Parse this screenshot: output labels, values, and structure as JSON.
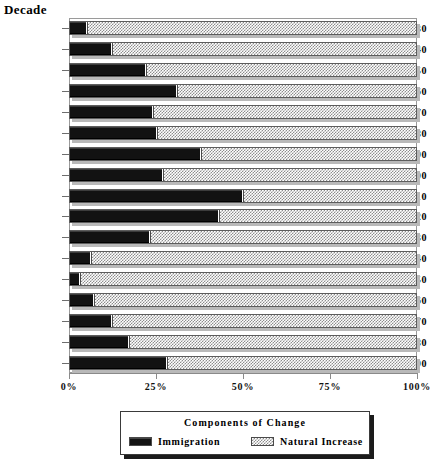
{
  "chart_data": {
    "type": "bar",
    "orientation": "horizontal",
    "stacked": true,
    "normalized_percent": true,
    "title": "",
    "ylabel": "Decade",
    "xlabel": "",
    "xlim": [
      0,
      100
    ],
    "xticks": [
      0,
      25,
      50,
      75,
      100
    ],
    "xtick_labels": [
      "0%",
      "25%",
      "50%",
      "75%",
      "100%"
    ],
    "grid": false,
    "legend_position": "bottom",
    "legend_title": "Components of Change",
    "categories": [
      "1820-30",
      "1830-40",
      "1840-50",
      "1850-60",
      "1860-70",
      "1870-80",
      "1880-90",
      "1890-00",
      "1900-10",
      "1910-20",
      "1920-30",
      "1930-40",
      "1940-50",
      "1950-60",
      "1960-70",
      "1970-80",
      "1980-90"
    ],
    "series": [
      {
        "name": "Immigration",
        "color": "#141414",
        "pattern": "solid",
        "values": [
          5,
          12,
          22,
          31,
          24,
          25,
          38,
          27,
          50,
          43,
          23,
          6,
          3,
          7,
          12,
          17,
          28
        ]
      },
      {
        "name": "Natural Increase",
        "color": "#8d8d8d",
        "pattern": "checker",
        "values": [
          95,
          88,
          78,
          69,
          76,
          75,
          62,
          73,
          50,
          57,
          77,
          94,
          97,
          93,
          88,
          83,
          72
        ]
      }
    ]
  }
}
